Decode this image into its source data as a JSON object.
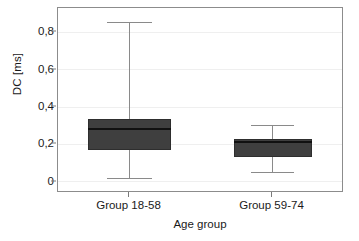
{
  "chart_data": {
    "type": "box",
    "title": "",
    "xlabel": "Age group",
    "ylabel": "DC [ms]",
    "ylim": [
      -0.06,
      0.93
    ],
    "ytick_values": [
      0,
      0.2,
      0.4,
      0.6,
      0.8
    ],
    "ytick_labels": [
      "0",
      "0,2",
      "0,4",
      "0,6",
      "0,8"
    ],
    "grid": true,
    "grid_axis": "y",
    "legend": "none",
    "categories": [
      "Group 18-58",
      "Group 59-74"
    ],
    "boxes": [
      {
        "category": "Group 18-58",
        "whisker_low": 0.02,
        "q1": 0.17,
        "median": 0.28,
        "q3": 0.335,
        "whisker_high": 0.85
      },
      {
        "category": "Group 59-74",
        "whisker_low": 0.05,
        "q1": 0.13,
        "median": 0.215,
        "q3": 0.23,
        "whisker_high": 0.3
      }
    ],
    "colors": {
      "box_fill": "#3f3f3f",
      "box_edge": "#2e2e2e",
      "median": "#111111",
      "whisker": "#8a8a8a",
      "frame": "#8c8c8c",
      "gridline": "#efefef",
      "background": "#ffffff",
      "text": "#1a1a1a"
    }
  }
}
